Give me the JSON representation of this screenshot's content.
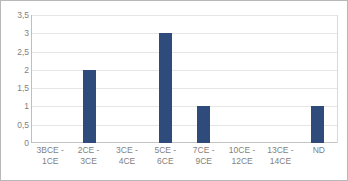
{
  "chart_data": {
    "type": "bar",
    "title": "",
    "subtitle": "",
    "xlabel": "",
    "ylabel": "",
    "categories": [
      "3BCE - 1CE",
      "2CE - 3CE",
      "3CE - 4CE",
      "5CE - 6CE",
      "7CE - 9CE",
      "10CE -\n12CE",
      "13CE -\n14CE",
      "ND"
    ],
    "values": [
      0,
      2,
      0,
      3,
      1,
      0,
      0,
      1
    ],
    "ylim": [
      0,
      3.5
    ],
    "ytick_values": [
      0,
      0.5,
      1,
      1.5,
      2,
      2.5,
      3,
      3.5
    ],
    "ytick_labels": [
      "0",
      "0,5",
      "1",
      "1,5",
      "2",
      "2,5",
      "3",
      "3,5"
    ],
    "grid": true,
    "legend": false,
    "legend_position": "none",
    "bar_color": "#2e4b7c",
    "gridline_color": "#e6e6e6",
    "axis_color": "#bfbfbf",
    "text_color": "#7f7f7f",
    "border_color": "#b8b8b8",
    "background_color": "#ffffff"
  }
}
